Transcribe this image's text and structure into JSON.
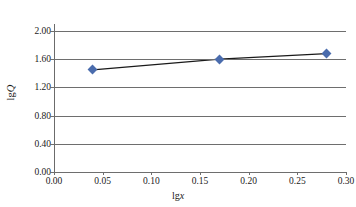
{
  "chart_data": {
    "type": "line",
    "title": "",
    "subtitle": "",
    "xlabel": "lgx",
    "xlabel_prefix": "lg",
    "xlabel_italic": "x",
    "ylabel": "lgQ",
    "ylabel_prefix": "lg",
    "ylabel_italic": "Q",
    "x": [
      0.04,
      0.17,
      0.28
    ],
    "values": [
      1.45,
      1.6,
      1.68
    ],
    "series": [
      {
        "name": "lgQ vs lgx",
        "x": [
          0.04,
          0.17,
          0.28
        ],
        "values": [
          1.45,
          1.6,
          1.68
        ],
        "marker": "diamond",
        "marker_color": "#4a6cad",
        "line_color": "#1a1a1a"
      }
    ],
    "xlim": [
      0.0,
      0.3
    ],
    "ylim": [
      0.0,
      2.0
    ],
    "xticks": [
      0.0,
      0.05,
      0.1,
      0.15,
      0.2,
      0.25,
      0.3
    ],
    "yticks": [
      0.0,
      0.4,
      0.8,
      1.2,
      1.6,
      2.0
    ],
    "xticklabels": [
      "0.00",
      "0.05",
      "0.10",
      "0.15",
      "0.20",
      "0.25",
      "0.30"
    ],
    "yticklabels": [
      "0.00",
      "0.40",
      "0.80",
      "1.20",
      "1.60",
      "2.00"
    ],
    "grid": "horizontal",
    "grid_color": "#6e6e6e",
    "legend": "none",
    "legend_position": "none",
    "background": "#ffffff",
    "annotations": []
  }
}
